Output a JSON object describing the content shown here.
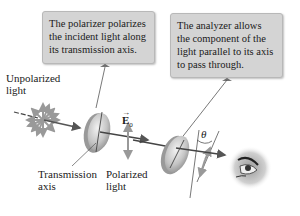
{
  "callouts": {
    "polarizer": [
      "The polarizer polarizes",
      "the incident light along",
      "its transmission axis."
    ],
    "analyzer": [
      "The analyzer allows",
      "the component of the",
      "light parallel to its axis",
      "to pass through."
    ]
  },
  "labels": {
    "unpolarized": [
      "Unpolarized",
      "light"
    ],
    "transmission": [
      "Transmission",
      "axis"
    ],
    "polarized": [
      "Polarized",
      "light"
    ],
    "e_field": "E",
    "e_sub": "0",
    "theta": "θ"
  },
  "icons": [
    "starburst-light-source-icon",
    "polarizer-disk-icon",
    "analyzer-disk-icon",
    "eye-icon"
  ],
  "colors": {
    "callout_bg": "#d4d4d4",
    "arrow": "#555555",
    "starburst": "#9a9a9a",
    "disk": "#c8c8c8"
  }
}
